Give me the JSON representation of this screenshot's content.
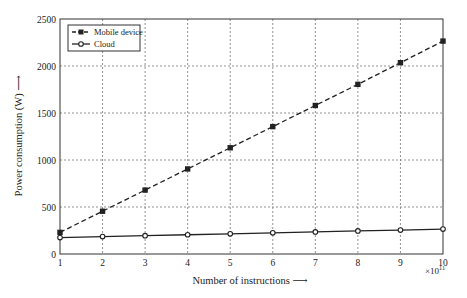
{
  "chart_data": {
    "type": "line",
    "title": "",
    "xlabel": "Number of instructions ⟶",
    "ylabel": "Power consumption (W) ⟶",
    "x_multiplier": "×10",
    "x_multiplier_exp": "11",
    "x": [
      1,
      2,
      3,
      4,
      5,
      6,
      7,
      8,
      9,
      10
    ],
    "xlim": [
      1,
      10
    ],
    "ylim": [
      0,
      2500
    ],
    "xticks": [
      1,
      2,
      3,
      4,
      5,
      6,
      7,
      8,
      9,
      10
    ],
    "yticks": [
      0,
      500,
      1000,
      1500,
      2000,
      2500
    ],
    "grid": true,
    "legend_position": "upper left",
    "series": [
      {
        "name": "Mobile device",
        "style": "dashed",
        "marker": "square",
        "color": "#222222",
        "values": [
          230,
          455,
          680,
          905,
          1130,
          1355,
          1580,
          1805,
          2035,
          2265
        ]
      },
      {
        "name": "Cloud",
        "style": "solid",
        "marker": "circle",
        "color": "#222222",
        "values": [
          175,
          185,
          195,
          205,
          215,
          225,
          235,
          245,
          255,
          265
        ]
      }
    ]
  }
}
